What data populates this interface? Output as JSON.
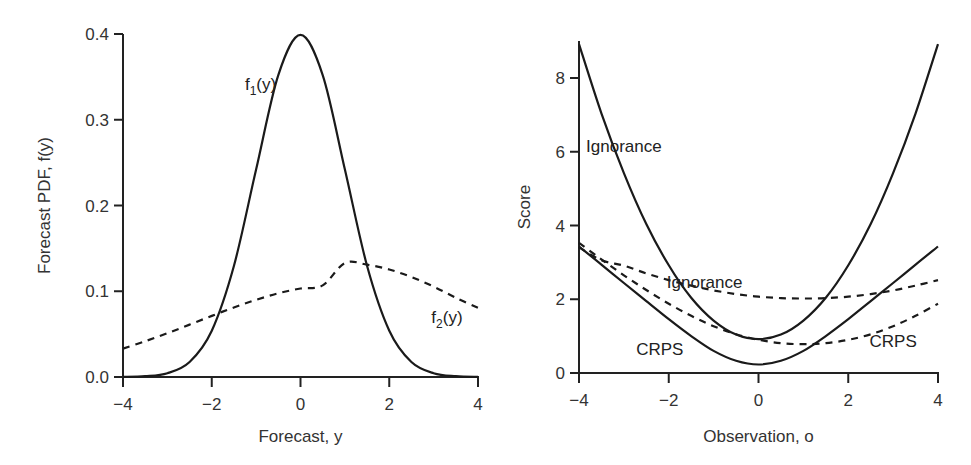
{
  "chart_data": [
    {
      "type": "line",
      "title": "",
      "xlabel": "Forecast, y",
      "ylabel": "Forecast PDF, f(y)",
      "xlim": [
        -4,
        4
      ],
      "ylim": [
        0,
        0.4
      ],
      "xticks": [
        "-4",
        "-2",
        "0",
        "2",
        "4"
      ],
      "yticks": [
        "0.0",
        "0.1",
        "0.2",
        "0.3",
        "0.4"
      ],
      "grid": false,
      "x": [
        -4,
        -3.5,
        -3,
        -2.5,
        -2,
        -1.5,
        -1,
        -0.5,
        0,
        0.5,
        1,
        1.5,
        2,
        2.5,
        3,
        3.5,
        4
      ],
      "series": [
        {
          "name": "f1(y)",
          "style": "solid",
          "values": [
            0.0001,
            0.0009,
            0.0044,
            0.0175,
            0.054,
            0.1295,
            0.242,
            0.3521,
            0.3989,
            0.3521,
            0.242,
            0.1295,
            0.054,
            0.0175,
            0.0044,
            0.0009,
            0.0001
          ]
        },
        {
          "name": "f2(y)",
          "style": "dashed",
          "values": [
            0.0331,
            0.0417,
            0.0511,
            0.0611,
            0.0713,
            0.0811,
            0.09,
            0.0976,
            0.1032,
            0.1068,
            0.133,
            0.131,
            0.1254,
            0.1166,
            0.1054,
            0.0925,
            0.0806
          ]
        }
      ],
      "annotations": [
        {
          "text": "f1(y)",
          "base": "f",
          "sub": "1",
          "rest": "(y)",
          "x": -0.9,
          "y": 0.335
        },
        {
          "text": "f2(y)",
          "base": "f",
          "sub": "2",
          "rest": "(y)",
          "x": 3.3,
          "y": 0.063
        }
      ]
    },
    {
      "type": "line",
      "title": "",
      "xlabel": "Observation, o",
      "ylabel": "Score",
      "xlim": [
        -4,
        4
      ],
      "ylim": [
        0,
        9
      ],
      "xticks": [
        "-4",
        "-2",
        "0",
        "2",
        "4"
      ],
      "yticks": [
        "0",
        "2",
        "4",
        "6",
        "8"
      ],
      "grid": false,
      "x": [
        -4,
        -3.5,
        -3,
        -2.5,
        -2,
        -1.5,
        -1,
        -0.5,
        0,
        0.5,
        1,
        1.5,
        2,
        2.5,
        3,
        3.5,
        4
      ],
      "series": [
        {
          "name": "Ignorance (f1)",
          "style": "solid",
          "values": [
            8.92,
            7.04,
            5.42,
            4.04,
            2.92,
            2.04,
            1.42,
            1.04,
            0.92,
            1.04,
            1.42,
            2.04,
            2.92,
            4.04,
            5.42,
            7.04,
            8.92
          ]
        },
        {
          "name": "CRPS (f1)",
          "style": "solid",
          "values": [
            3.43,
            2.94,
            2.44,
            1.95,
            1.46,
            1.0,
            0.6,
            0.33,
            0.23,
            0.33,
            0.6,
            1.0,
            1.46,
            1.95,
            2.44,
            2.94,
            3.43
          ]
        },
        {
          "name": "Ignorance (f2)",
          "style": "dashed",
          "values": [
            3.41,
            3.06,
            2.91,
            2.7,
            2.52,
            2.37,
            2.24,
            2.14,
            2.07,
            2.03,
            2.02,
            2.03,
            2.07,
            2.14,
            2.24,
            2.37,
            2.52
          ]
        },
        {
          "name": "CRPS (f2)",
          "style": "dashed",
          "values": [
            3.53,
            3.08,
            2.65,
            2.25,
            1.88,
            1.55,
            1.27,
            1.05,
            0.9,
            0.81,
            0.78,
            0.81,
            0.9,
            1.05,
            1.27,
            1.55,
            1.88
          ]
        }
      ],
      "annotations": [
        {
          "text": "Ignorance",
          "x": -3.0,
          "y": 6.0
        },
        {
          "text": "Ignorance",
          "x": -1.2,
          "y": 2.3
        },
        {
          "text": "CRPS",
          "x": -2.2,
          "y": 0.5
        },
        {
          "text": "CRPS",
          "x": 3.0,
          "y": 0.7
        }
      ]
    }
  ]
}
